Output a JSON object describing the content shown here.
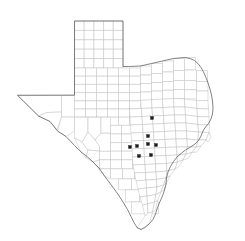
{
  "figure": {
    "kind": "county-outline-map",
    "region_title": "Texas",
    "background_color": "#ffffff",
    "county_line_color": "#b9b9bd",
    "state_outline_color": "#5a5a5f",
    "marker_color": "#1c1c1c",
    "marker_shape": "square",
    "marker_size_px": 3,
    "caption": "",
    "legend": "",
    "title": ""
  },
  "chart_data": {
    "type": "scatter",
    "title": "",
    "xlabel": "",
    "ylabel": "",
    "grid": false,
    "legend": "none",
    "xlim": [
      0,
      245
    ],
    "ylim": [
      241,
      0
    ],
    "markers": [
      {
        "id": "m1",
        "x": 152,
        "y": 118
      },
      {
        "id": "m2",
        "x": 148,
        "y": 136
      },
      {
        "id": "m3",
        "x": 137,
        "y": 146
      },
      {
        "id": "m4",
        "x": 148,
        "y": 144
      },
      {
        "id": "m5",
        "x": 156,
        "y": 145
      },
      {
        "id": "m6",
        "x": 130,
        "y": 147
      },
      {
        "id": "m7",
        "x": 139,
        "y": 156
      },
      {
        "id": "m8",
        "x": 151,
        "y": 155
      }
    ],
    "marker_count": 8
  },
  "geometry": {
    "state_outline": "M61.5,95.2 L17.5,95.3 L38.5,116.0 L50.0,121.5 L57.5,131.0 L66.0,136.5 L74.5,145.5 L81.0,152.0 L87.0,156.5 L93.0,162.0 L99.0,168.0 L104.5,176.0 L109.0,182.0 L113.5,188.0 L118.5,195.0 L123.0,202.0 L127.5,209.5 L131.0,216.5 L134.0,222.5 L137.0,227.5 L141.0,229.5 L145.0,227.5 L149.5,223.5 L153.0,219.5 L155.5,214.0 L157.5,207.5 L160.0,201.5 L162.5,196.0 L164.5,190.0 L166.0,184.0 L166.5,178.0 L168.0,172.0 L170.5,166.5 L173.5,161.5 L177.0,157.0 L181.0,153.5 L185.5,150.0 L190.5,147.0 L195.0,144.0 L198.5,140.5 L201.0,136.0 L203.0,131.0 L205.5,127.0 L208.5,123.5 L211.0,119.0 L212.5,114.0 L213.0,108.0 L212.5,101.0 L211.5,95.0 L210.0,89.0 L208.0,83.0 L206.0,77.5 L203.5,72.0 L201.0,67.5 L198.0,63.5 L194.5,60.5 L190.0,58.5 L185.0,57.0 L180.0,56.5 L175.0,57.0 L170.0,58.0 L165.0,59.5 L160.0,61.5 L155.0,63.5 L150.0,65.5 L145.0,67.5 L140.5,69.5 L137.0,72.0 L134.0,75.0 L131.0,78.0 L128.5,81.5 L126.5,85.0 L125.0,88.5 L124.0,92.0 L123.5,95.5 L123.0,99.0 L123.0,95.0 L123.0,21.0 L74.5,21.0 L74.5,95.2 Z",
    "note": "Simplified boundary path in screenshot pixel coordinates"
  }
}
